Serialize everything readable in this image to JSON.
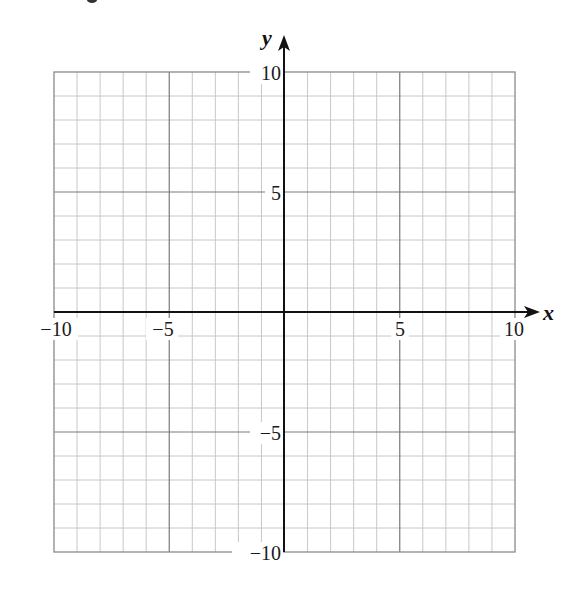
{
  "chart_data": {
    "type": "scatter",
    "title": "",
    "xlabel": "x",
    "ylabel": "y",
    "xlim": [
      -10,
      10
    ],
    "ylim": [
      -10,
      10
    ],
    "x_ticks": [
      -10,
      -5,
      5,
      10
    ],
    "y_ticks": [
      10,
      5,
      -5,
      -10
    ],
    "x_tick_labels": [
      "−10",
      "−5",
      "5",
      "10"
    ],
    "y_tick_labels": [
      "10",
      "5",
      "−5",
      "−10"
    ],
    "grid": true,
    "minor_grid_step": 1,
    "major_grid_step": 5,
    "series": [],
    "legend": null
  },
  "axes": {
    "x_label": "x",
    "y_label": "y"
  },
  "colors": {
    "minor_grid": "#c8c8c8",
    "major_grid": "#7a7a7a",
    "border": "#8a8a8a",
    "axis": "#111111"
  }
}
